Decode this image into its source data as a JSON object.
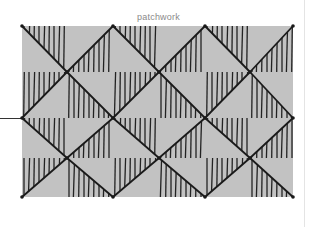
{
  "title": "patchwork",
  "colors": {
    "background": "#ffffff",
    "patch_fill": "#c2c2c2",
    "ink": "#1a1a1a",
    "hatch": "#222222"
  },
  "grid": {
    "x_edges": [
      22,
      67,
      113,
      159,
      205,
      250,
      293
    ],
    "y_edges": [
      26,
      72,
      118,
      158,
      197
    ],
    "hatch_spacing": 5
  },
  "cells": [
    [
      {
        "d": "\\",
        "h": "ur"
      },
      {
        "d": "/",
        "h": "lr"
      },
      {
        "d": "\\",
        "h": "ur"
      },
      {
        "d": "/",
        "h": "lr"
      },
      {
        "d": "\\",
        "h": "ur"
      },
      {
        "d": "/",
        "h": "lr"
      }
    ],
    [
      {
        "d": "/",
        "h": "ul"
      },
      {
        "d": "\\",
        "h": "ll"
      },
      {
        "d": "/",
        "h": "ul"
      },
      {
        "d": "\\",
        "h": "ll"
      },
      {
        "d": "/",
        "h": "ul"
      },
      {
        "d": "\\",
        "h": "ll"
      }
    ],
    [
      {
        "d": "\\",
        "h": "ur"
      },
      {
        "d": "/",
        "h": "lr"
      },
      {
        "d": "\\",
        "h": "ur"
      },
      {
        "d": "/",
        "h": "lr"
      },
      {
        "d": "\\",
        "h": "ur"
      },
      {
        "d": "/",
        "h": "lr"
      }
    ],
    [
      {
        "d": "/",
        "h": "ul"
      },
      {
        "d": "\\",
        "h": "ll"
      },
      {
        "d": "/",
        "h": "ul"
      },
      {
        "d": "\\",
        "h": "ll"
      },
      {
        "d": "/",
        "h": "ul"
      },
      {
        "d": "\\",
        "h": "ll"
      }
    ]
  ]
}
